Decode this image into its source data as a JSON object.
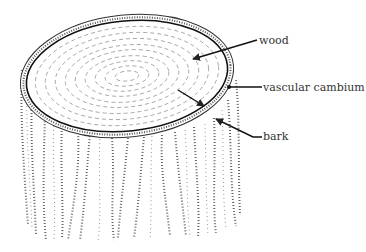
{
  "diagram": {
    "labels": [
      {
        "id": "wood",
        "text": "wood",
        "x": 259,
        "y": 35
      },
      {
        "id": "vascular-cambium",
        "text": "vascular cambium",
        "x": 263,
        "y": 82
      },
      {
        "id": "bark",
        "text": "bark",
        "x": 263,
        "y": 131
      }
    ],
    "colors": {
      "ink": "#222222",
      "text": "#333333",
      "background": "#ffffff"
    }
  }
}
